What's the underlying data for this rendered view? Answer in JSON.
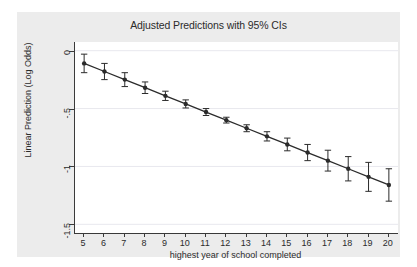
{
  "figure": {
    "background_color": "#ececec",
    "plot_background_color": "#ffffff",
    "axis_color": "#3a3a3a",
    "grid_color": "#e8e8ee",
    "series_color": "#2b2b2b"
  },
  "chart_data": {
    "type": "line",
    "title": "Adjusted Predictions with 95% CIs",
    "xlabel": "highest year of school completed",
    "ylabel": "Linear Prediction (Log Odds)",
    "x": [
      5,
      6,
      7,
      8,
      9,
      10,
      11,
      12,
      13,
      14,
      15,
      16,
      17,
      18,
      19,
      20
    ],
    "xtick_labels": [
      "5",
      "6",
      "7",
      "8",
      "9",
      "10",
      "11",
      "12",
      "13",
      "14",
      "15",
      "16",
      "17",
      "18",
      "19",
      "20"
    ],
    "ytick_values": [
      0,
      -0.5,
      -1,
      -1.5
    ],
    "ytick_labels": [
      "0",
      "-.5",
      "-1",
      "-1.5"
    ],
    "xlim": [
      4.55,
      20.45
    ],
    "ylim": [
      -1.575,
      0.075
    ],
    "grid": true,
    "grid_axis": "y",
    "legend": false,
    "series": [
      {
        "name": "Linear prediction",
        "values": [
          -0.11,
          -0.18,
          -0.25,
          -0.32,
          -0.39,
          -0.46,
          -0.53,
          -0.6,
          -0.67,
          -0.74,
          -0.81,
          -0.88,
          -0.95,
          -1.02,
          -1.09,
          -1.16
        ],
        "ci_lower": [
          -0.19,
          -0.25,
          -0.31,
          -0.37,
          -0.43,
          -0.495,
          -0.56,
          -0.625,
          -0.7,
          -0.78,
          -0.865,
          -0.95,
          -1.04,
          -1.125,
          -1.215,
          -1.3
        ],
        "ci_upper": [
          -0.03,
          -0.11,
          -0.19,
          -0.27,
          -0.35,
          -0.425,
          -0.5,
          -0.575,
          -0.64,
          -0.7,
          -0.755,
          -0.81,
          -0.86,
          -0.915,
          -0.965,
          -1.02
        ],
        "marker": "circle",
        "line_style": "solid"
      }
    ]
  }
}
